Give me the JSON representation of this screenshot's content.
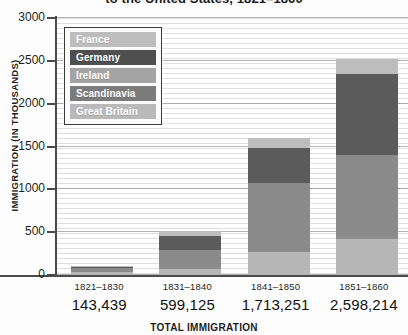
{
  "chart_data": {
    "type": "bar",
    "stacked": true,
    "title": "to the United States, 1821–1860",
    "title_note": "Chart title is cropped at the top edge of the screenshot; only the second line is visible.",
    "xlabel": "TOTAL IMMIGRATION",
    "ylabel": "IMMIGRATION (IN THOUSANDS)",
    "ylim": [
      0,
      3000
    ],
    "yticks": [
      0,
      500,
      1000,
      1500,
      2000,
      2500,
      3000
    ],
    "ytick_labels": [
      "0",
      "500",
      "1000",
      "1500",
      "2000",
      "2500",
      "3000"
    ],
    "grid": true,
    "legend_position": "upper-left-inside",
    "categories": [
      "1821–1830",
      "1831–1840",
      "1841–1850",
      "1851–1860"
    ],
    "totals_label": [
      "143,439",
      "599,125",
      "1,713,251",
      "2,598,214"
    ],
    "totals": [
      143439,
      599125,
      1713251,
      2598214
    ],
    "series": [
      {
        "name": "Great Britain",
        "color": "#b6b6b6",
        "values": [
          30,
          75,
          265,
          425
        ]
      },
      {
        "name": "Scandinavia",
        "color": "#8f8f8f",
        "values": [
          0,
          10,
          20,
          25
        ]
      },
      {
        "name": "Ireland",
        "color": "#8a8a8a",
        "values": [
          55,
          210,
          785,
          950
        ]
      },
      {
        "name": "Germany",
        "color": "#5b5b5b",
        "values": [
          10,
          160,
          410,
          950
        ]
      },
      {
        "name": "France",
        "color": "#bdbdbd",
        "values": [
          10,
          55,
          125,
          175
        ]
      }
    ],
    "series_order_bottom_to_top": [
      "Great Britain",
      "Scandinavia",
      "Ireland",
      "Germany",
      "France"
    ]
  },
  "legend": {
    "items": [
      {
        "label": "France",
        "color": "#bdbdbd"
      },
      {
        "label": "Germany",
        "color": "#4f4f4f"
      },
      {
        "label": "Ireland",
        "color": "#a4a4a4"
      },
      {
        "label": "Scandinavia",
        "color": "#7b7b7b"
      },
      {
        "label": "Great Britain",
        "color": "#b9b9b9"
      }
    ]
  },
  "colors": {
    "axis": "#4a4a4a",
    "gridline": "#9a9a9a",
    "text": "#1d1d1d",
    "background": "#ffffff"
  }
}
